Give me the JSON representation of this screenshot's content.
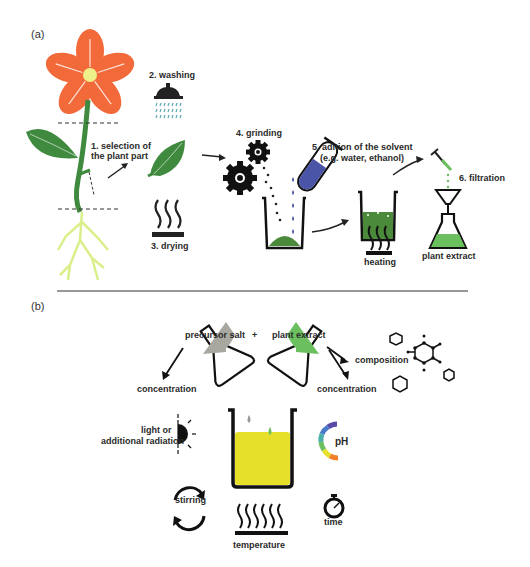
{
  "panels": {
    "a": {
      "label": "(a)",
      "steps": [
        {
          "id": 1,
          "label_line1": "1. selection of",
          "label_line2": "the plant part",
          "icon": "plant-icon"
        },
        {
          "id": 2,
          "label": "2. washing",
          "icon": "shower-icon"
        },
        {
          "id": 3,
          "label": "3. drying",
          "icon": "heat-waves-icon"
        },
        {
          "id": 4,
          "label": "4. grinding",
          "icon": "gears-icon"
        },
        {
          "id": 5,
          "label_line1": "5. adition of the solvent",
          "label_line2": "(e.g. water, ethanol)",
          "icon": "test-tube-icon"
        },
        {
          "id": 6,
          "label": "6. filtration",
          "icon": "funnel-flask-icon"
        }
      ],
      "heating_label": "heating",
      "product_label": "plant extract"
    },
    "b": {
      "label": "(b)",
      "reactants": {
        "left": "precursor salt",
        "plus": "+",
        "right": "plant extract"
      },
      "factors": {
        "concentration_left": "concentration",
        "concentration_right": "concentration",
        "composition": "composition",
        "light_line1": "light or",
        "light_line2": "additional radiation",
        "ph": "pH",
        "stirring": "stirring",
        "time": "time",
        "temperature": "temperature"
      }
    }
  },
  "colors": {
    "flower_petal": "#f26a3a",
    "flower_center": "#eef08a",
    "leaf_green": "#3f8a3f",
    "root_yellow": "#d9ef8a",
    "solvent_blue": "#4a55a8",
    "extract_green": "#6cbf5f",
    "precursor_grey": "#a8a8a0",
    "reaction_yellow": "#e6e02a",
    "water_drop": "#5fa8b8"
  }
}
